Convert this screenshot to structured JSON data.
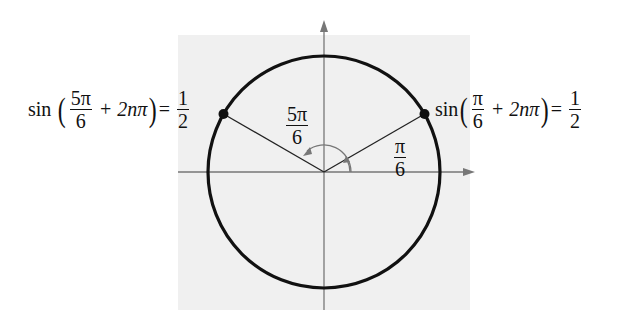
{
  "diagram": {
    "type": "unit-circle",
    "background_color": "#f0f0f0",
    "circle_color": "#111111",
    "axis_color": "#777777",
    "points": [
      {
        "angle": "π/6",
        "label": "π/6"
      },
      {
        "angle": "5π/6",
        "label": "5π/6"
      }
    ]
  },
  "left_equation": {
    "func": "sin",
    "frac_num": "5π",
    "frac_den": "6",
    "plus_term": "+ 2nπ",
    "equals": "=",
    "rhs_num": "1",
    "rhs_den": "2"
  },
  "right_equation": {
    "func": "sin",
    "frac_num": "π",
    "frac_den": "6",
    "plus_term": "+ 2nπ",
    "equals": "=",
    "rhs_num": "1",
    "rhs_den": "2"
  },
  "angle_labels": {
    "large_num": "5π",
    "large_den": "6",
    "small_num": "π",
    "small_den": "6"
  }
}
